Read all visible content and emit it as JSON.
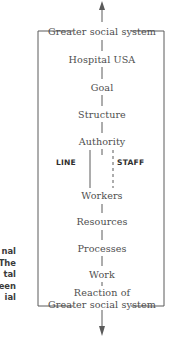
{
  "diagram": {
    "center_x": 102,
    "stroke_color": "#5a5a5a",
    "text_color": "#4e4e4e",
    "background": "#ffffff",
    "top_arrow": {
      "name": "up-arrow",
      "direction": "up"
    },
    "bottom_arrow": {
      "name": "down-arrow",
      "direction": "down"
    },
    "nodes": [
      {
        "id": "greater-social-system-top",
        "label": "Greater social system",
        "y": 26
      },
      {
        "id": "hospital-usa",
        "label": "Hospital USA",
        "y": 54
      },
      {
        "id": "goal",
        "label": "Goal",
        "y": 82
      },
      {
        "id": "structure",
        "label": "Structure",
        "y": 109
      },
      {
        "id": "authority",
        "label": "Authority",
        "y": 136
      },
      {
        "id": "workers",
        "label": "Workers",
        "y": 190
      },
      {
        "id": "resources",
        "label": "Resources",
        "y": 216
      },
      {
        "id": "processes",
        "label": "Processes",
        "y": 243
      },
      {
        "id": "work",
        "label": "Work",
        "y": 269
      },
      {
        "id": "reaction-of",
        "label": "Reaction of",
        "y": 287
      },
      {
        "id": "greater-social-system-bottom",
        "label": "Greater social system",
        "y": 299
      }
    ],
    "branches": {
      "line": {
        "label": "LINE",
        "style": "solid",
        "x": 90
      },
      "staff": {
        "label": "STAFF",
        "style": "dashed",
        "x": 113
      }
    },
    "side_caption": {
      "note": "caption text clipped at left edge of the figure",
      "lines": [
        "nal",
        "The",
        "tal",
        "een",
        "ial"
      ]
    }
  }
}
